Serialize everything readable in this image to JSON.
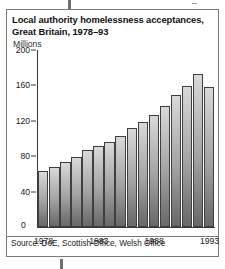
{
  "figure": {
    "title_line1": "Local authority homelessness acceptances,",
    "title_line2": "Great Britain, 1978–93",
    "unit_label": "Millions",
    "source": "Source: DoE, Scottish Office, Welsh Office",
    "zero_label": "0",
    "frame_color": "#7b7b7b",
    "bar_fill_light": "#d9d9d9",
    "bar_fill_dark": "#686868",
    "bar_outline": "#3f3f3f",
    "axis_color": "#3a3a3a"
  },
  "chart_data": {
    "type": "bar",
    "title": "Local authority homelessness acceptances, Great Britain, 1978–93",
    "xlabel": "",
    "ylabel": "Millions",
    "ylim": [
      0,
      200
    ],
    "yticks": [
      0,
      40,
      80,
      120,
      160,
      200
    ],
    "ytick_labels": [
      "0",
      "40",
      "80",
      "120",
      "160",
      "200"
    ],
    "xtick_labels": [
      "1978",
      "1983",
      "1988",
      "1993"
    ],
    "xtick_categories": [
      "1978",
      "1983",
      "1988",
      "1993"
    ],
    "grid": false,
    "legend": null,
    "categories": [
      "1978",
      "1979",
      "1980",
      "1981",
      "1982",
      "1983",
      "1984",
      "1985",
      "1986",
      "1987",
      "1988",
      "1989",
      "1990",
      "1991",
      "1992",
      "1993"
    ],
    "values": [
      63,
      68,
      73,
      79,
      87,
      92,
      96,
      103,
      112,
      119,
      127,
      137,
      149,
      159,
      173,
      158
    ]
  }
}
